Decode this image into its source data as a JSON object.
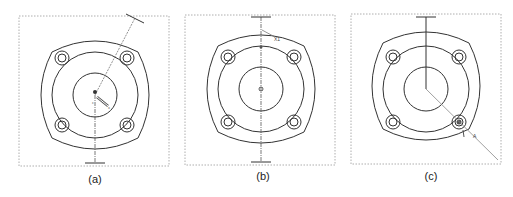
{
  "figure": {
    "panels": [
      {
        "id": "a",
        "caption": "(a)",
        "description": "Flange with four bolt holes; dimension leader from center to upper-right at angle"
      },
      {
        "id": "b",
        "caption": "(b)",
        "description": "Flange with vertical centerline; annotation marker near top edge"
      },
      {
        "id": "c",
        "caption": "(c)",
        "description": "Flange with leader from center to lower-right bolt hole"
      }
    ],
    "marker_labels": {
      "b_label": "X1",
      "c_label": "A"
    }
  },
  "colors": {
    "line": "#333333",
    "dashed": "#888888",
    "background": "#ffffff"
  }
}
